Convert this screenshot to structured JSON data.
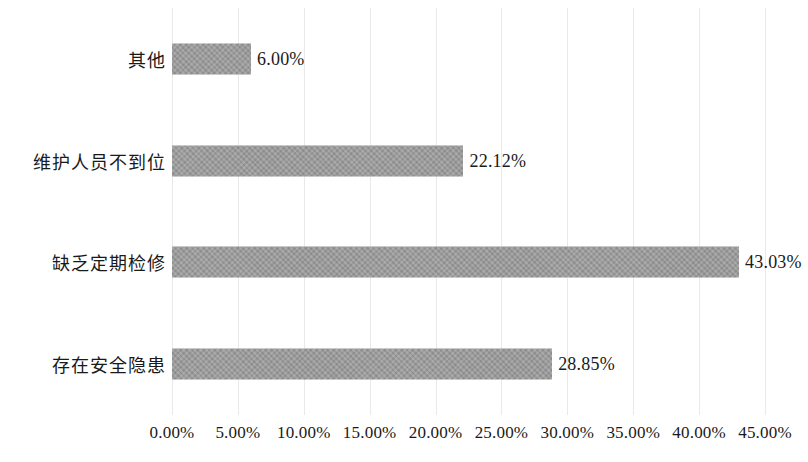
{
  "chart_data": {
    "type": "bar",
    "orientation": "horizontal",
    "title": "",
    "subtitle": "",
    "xlabel": "",
    "ylabel": "",
    "categories": [
      "其他",
      "维护人员不到位",
      "缺乏定期检修",
      "存在安全隐患"
    ],
    "values": [
      6.0,
      22.12,
      43.03,
      28.85
    ],
    "value_labels": [
      "6.00%",
      "22.12%",
      "43.03%",
      "28.85%"
    ],
    "xlim": [
      0,
      45
    ],
    "xtick_values": [
      0,
      5,
      10,
      15,
      20,
      25,
      30,
      35,
      40,
      45
    ],
    "xtick_labels": [
      "0.00%",
      "5.00%",
      "10.00%",
      "15.00%",
      "20.00%",
      "25.00%",
      "30.00%",
      "35.00%",
      "40.00%",
      "45.00%"
    ],
    "grid": true,
    "grid_axis": "x",
    "legend": false,
    "legend_position": "none",
    "bar_color": "#9a9a9a",
    "grid_color": "#e9e9e9",
    "text_color": "#1a1a1a",
    "background_color": "#ffffff"
  }
}
